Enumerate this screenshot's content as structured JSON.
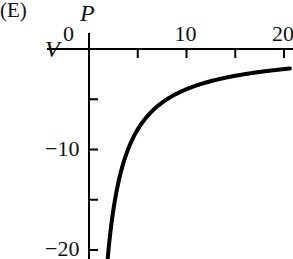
{
  "panel_label": "(E)",
  "chart_data": {
    "type": "line",
    "title": "",
    "xlabel": "P",
    "ylabel": "V",
    "x_ticks": [
      0,
      5,
      10,
      15,
      20
    ],
    "x_tick_labels": [
      "0",
      "",
      "10",
      "",
      "20"
    ],
    "y_ticks": [
      0,
      -5,
      -10,
      -15,
      -20
    ],
    "y_tick_labels": [
      "0",
      "",
      "-10",
      "",
      "-20"
    ],
    "xlim": [
      0,
      20.6
    ],
    "ylim": [
      -21,
      0
    ],
    "grid": false,
    "legend": null,
    "series": [
      {
        "name": "V = -40/P",
        "x": [
          1.9,
          2,
          2.5,
          3,
          4,
          5,
          6,
          8,
          10,
          12,
          14,
          16,
          18,
          20,
          20.6
        ],
        "y": [
          -21.05,
          -20,
          -16,
          -13.33,
          -10,
          -8,
          -6.67,
          -5,
          -4,
          -3.33,
          -2.86,
          -2.5,
          -2.22,
          -2,
          -1.94
        ]
      }
    ],
    "axis_color": "#000000",
    "line_color": "#000000"
  }
}
